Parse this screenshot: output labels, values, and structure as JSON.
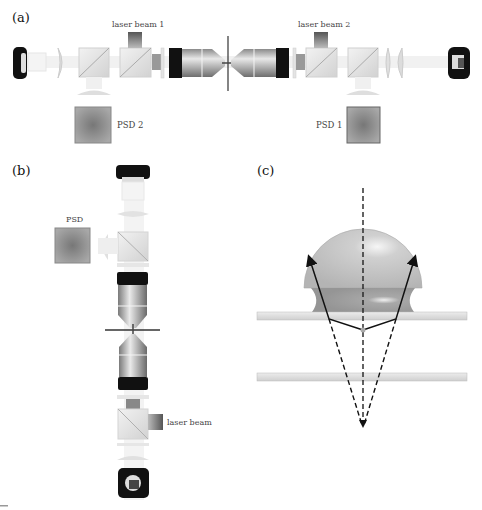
{
  "panels": {
    "a": {
      "label": "(a)",
      "laser_beam_1": "laser beam 1",
      "laser_beam_2": "laser beam 2",
      "psd_left": "PSD 2",
      "psd_right": "PSD 1"
    },
    "b": {
      "label": "(b)",
      "psd": "PSD",
      "laser_beam": "laser beam"
    },
    "c": {
      "label": "(c)"
    }
  },
  "colors": {
    "background": "#ffffff",
    "black_ring": "#111111",
    "objective_gray": "#a8a8a8",
    "cube_light": "#e6e6e6",
    "psd_gray": "#8c8c8c",
    "bead_gray": "#c4c4c4",
    "water_gray": "#9a9a9a",
    "slide_gray": "#dcdcdc",
    "ray": "#111111"
  }
}
